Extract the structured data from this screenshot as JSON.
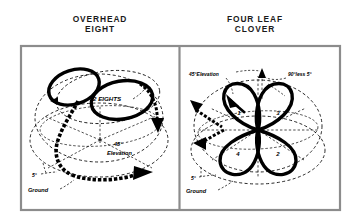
{
  "figure": {
    "panels": [
      {
        "id": "overhead-eight",
        "title_line1": "OVERHEAD",
        "title_line2": "EIGHT",
        "labels": {
          "maneuver_count": "2 EIGHTS",
          "elevation_deg": "45°",
          "elevation_word": "Elevation",
          "low_angle": "5°",
          "ground": "Ground"
        }
      },
      {
        "id": "four-leaf-clover",
        "title_line1": "FOUR LEAF",
        "title_line2": "CLOVER",
        "labels": {
          "elevation": "45°Elevation",
          "complement": "90°less 5°",
          "low_angle": "5°",
          "ground": "Ground"
        },
        "leaf_numbers": [
          "1",
          "3",
          "2",
          "4"
        ]
      }
    ],
    "colors": {
      "ink": "#000000",
      "frame": "#8c8c8c",
      "background": "#ffffff",
      "title": "#1a1a1a"
    }
  }
}
